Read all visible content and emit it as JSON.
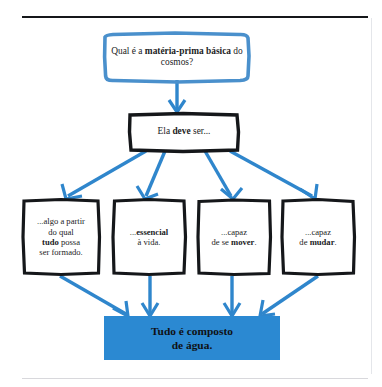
{
  "page": {
    "running_head_left": "",
    "running_head_right": "",
    "rule_color": "#15171a",
    "background": "#ffffff"
  },
  "colors": {
    "sketch_blue": "#4a90cc",
    "arrow_blue": "#2f86cc",
    "conclusion_fill": "#2b89d2",
    "sketch_black": "#15171a",
    "text": "#1b1c1e"
  },
  "diagram": {
    "type": "flowchart",
    "question": {
      "id": "node-question",
      "text_plain": "Qual é a matéria-prima básica do cosmos?",
      "text_html": "Qual é a <b>matéria-prima básica</b> do cosmos?",
      "border_style": "hand-drawn",
      "border_color": "#4a90cc"
    },
    "premise": {
      "id": "node-must",
      "text_plain": "Ela deve ser...",
      "text_html": "Ela <b>deve</b> ser...",
      "border_style": "hand-drawn",
      "border_color": "#15171a"
    },
    "criteria": [
      {
        "id": "node-crit-0",
        "text_plain": "...algo a partir do qual tudo possa ser formado.",
        "text_html": "...algo a partir<br>do qual<br><b>tudo</b> possa<br>ser formado.",
        "border_color": "#15171a"
      },
      {
        "id": "node-crit-1",
        "text_plain": "...essencial à vida.",
        "text_html": "...<b>essencial</b><br>à vida.",
        "border_color": "#15171a"
      },
      {
        "id": "node-crit-2",
        "text_plain": "...capaz de se mover.",
        "text_html": "...capaz<br>de se <b>mover</b>.",
        "border_color": "#15171a"
      },
      {
        "id": "node-crit-3",
        "text_plain": "...capaz de mudar.",
        "text_html": "...capaz<br>de <b>mudar</b>.",
        "border_color": "#15171a"
      }
    ],
    "conclusion": {
      "id": "node-conclusion",
      "text_plain": "Tudo é composto de água.",
      "text_html": "Tudo é composto<br>de água.",
      "fill": "#2b89d2"
    },
    "arrows": [
      {
        "name": "arrow-question-to-premise",
        "from": "node-question",
        "to": "node-must",
        "color": "#2f86cc"
      },
      {
        "name": "arrow-premise-to-criterion-0",
        "from": "node-must",
        "to": "node-crit-0",
        "color": "#2f86cc"
      },
      {
        "name": "arrow-premise-to-criterion-1",
        "from": "node-must",
        "to": "node-crit-1",
        "color": "#2f86cc"
      },
      {
        "name": "arrow-premise-to-criterion-2",
        "from": "node-must",
        "to": "node-crit-2",
        "color": "#2f86cc"
      },
      {
        "name": "arrow-premise-to-criterion-3",
        "from": "node-must",
        "to": "node-crit-3",
        "color": "#2f86cc"
      },
      {
        "name": "arrow-criterion-0-to-conclusion",
        "from": "node-crit-0",
        "to": "node-conclusion",
        "color": "#2f86cc"
      },
      {
        "name": "arrow-criterion-1-to-conclusion",
        "from": "node-crit-1",
        "to": "node-conclusion",
        "color": "#2f86cc"
      },
      {
        "name": "arrow-criterion-2-to-conclusion",
        "from": "node-crit-2",
        "to": "node-conclusion",
        "color": "#2f86cc"
      },
      {
        "name": "arrow-criterion-3-to-conclusion",
        "from": "node-crit-3",
        "to": "node-conclusion",
        "color": "#2f86cc"
      }
    ]
  }
}
